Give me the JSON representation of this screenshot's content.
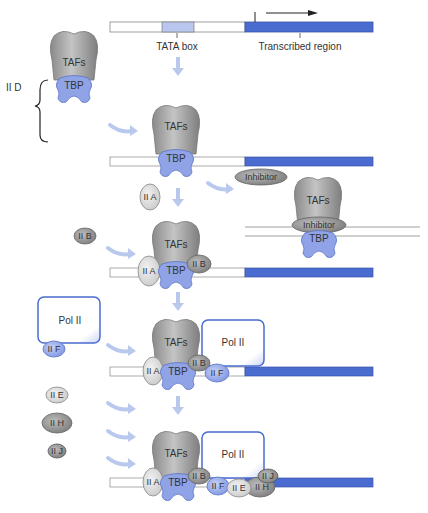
{
  "colors": {
    "taf_gray": "#a9a9a9",
    "tbp_blue": "#8fa3e6",
    "dna_blue": "#4a6bd0",
    "tata_light": "#b8c6f0",
    "arrow_light": "#b9c9ee",
    "factor_light": "#e0e0e0",
    "factor_dark": "#9a9a9a"
  },
  "gene": {
    "tata_label": "TATA box",
    "transcribed_label": "Transcribed region"
  },
  "complex": {
    "group_label": "II D",
    "tafs": "TAFs",
    "tbp": "TBP"
  },
  "factors": {
    "iia": "II A",
    "iib": "II B",
    "iif": "II F",
    "iie": "II E",
    "iih": "II H",
    "iij": "II J",
    "pol2": "Pol II",
    "inhibitor": "Inhibitor"
  },
  "steps": [
    {
      "id": "tfiid-binding",
      "adds": [
        "II D"
      ]
    },
    {
      "id": "inhibitor-branch",
      "adds": [
        "Inhibitor"
      ]
    },
    {
      "id": "iia-iib-binding",
      "adds": [
        "II A",
        "II B"
      ]
    },
    {
      "id": "pol2-iif-binding",
      "adds": [
        "Pol II",
        "II F"
      ]
    },
    {
      "id": "iie-iih-iij-binding",
      "adds": [
        "II E",
        "II H",
        "II J"
      ]
    }
  ]
}
